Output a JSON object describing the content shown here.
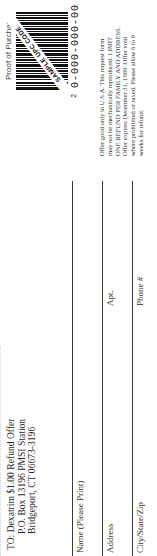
{
  "mailing": {
    "to_label": "TO:",
    "line1": "Dexatrim $1.00 Refund Offer",
    "line2": "P.O. Box 13196 PMSI Station",
    "line3": "Bridgeport, CT 06673-3196"
  },
  "form": {
    "fields": [
      {
        "label": "Name (Please Print)",
        "secondary_label": ""
      },
      {
        "label": "Address",
        "secondary_label": "Apt."
      },
      {
        "label": "City/State/Zip",
        "secondary_label": "Phone #"
      }
    ]
  },
  "proof_of_purchase": {
    "title": "Proof of Purchase",
    "barcode_overlay": "SAMPLE UPC CODE",
    "upc_number": "0-000-000-00",
    "check_digit": "2"
  },
  "terms": {
    "text": "Offer good only in U.S.A. This request form may not be mechanically reproduced. LIMIT ONE REFUND PER FAMILY AND ADDRESS. Offer expires December 31, 1989. Offer void where prohibited or taxed. Please allow 6 to 8 weeks for refund."
  },
  "colors": {
    "ink": "#2a2a2a",
    "background": "#ffffff"
  }
}
